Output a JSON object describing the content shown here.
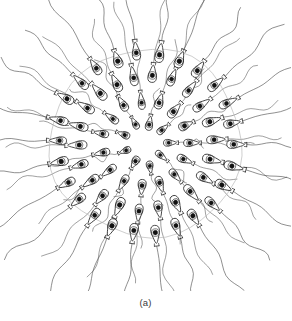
{
  "figure": {
    "caption": "(a)",
    "view": "whole-colony radial view",
    "background_color": "#ffffff",
    "ink_color": "#1a1a1a",
    "envelope_color": "#b9b9b9",
    "flagellum_color": "#4a4a4a"
  },
  "chart_data": {
    "type": "scatter",
    "title": "",
    "subtitle": "",
    "xlabel": "",
    "ylabel": "",
    "grid": false,
    "legend_position": "none",
    "annotations": [
      "(a)"
    ],
    "center": {
      "x": 146,
      "y": 143
    },
    "rings": [
      {
        "name": "core",
        "radius": 22,
        "cell_count": 9,
        "cell_length": 13,
        "cell_width": 8,
        "flagellum_length": 26
      },
      {
        "name": "inner",
        "radius": 44,
        "cell_count": 15,
        "cell_length": 16,
        "cell_width": 9,
        "flagellum_length": 46
      },
      {
        "name": "middle",
        "radius": 68,
        "cell_count": 22,
        "cell_length": 18,
        "cell_width": 10,
        "flagellum_length": 62
      },
      {
        "name": "outer",
        "radius": 90,
        "cell_count": 26,
        "cell_length": 18,
        "cell_width": 10,
        "flagellum_length": 74
      }
    ],
    "envelope": {
      "radius_x": 96,
      "radius_y": 94,
      "stroke": "#b9b9b9",
      "stroke_width": 0.7
    },
    "total_cells": 72,
    "cell_shape": "pear / teardrop with circular nucleus",
    "nucleus_fill": "#111111"
  },
  "elements": {
    "colony_name": "cell-colony",
    "envelope_name": "gelatinous-envelope",
    "cell_name": "flagellate-cell",
    "nucleus_name": "cell-nucleus",
    "flagellum_name": "flagellum"
  }
}
